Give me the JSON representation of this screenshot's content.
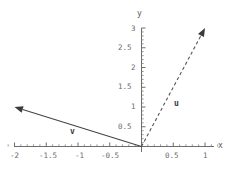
{
  "chart_data": {
    "type": "scatter",
    "title": "",
    "xlabel": "x",
    "ylabel": "y",
    "xlim": [
      -2.12,
      1.25
    ],
    "ylim": [
      -0.12,
      3.12
    ],
    "grid": false,
    "legend": "none",
    "x_ticks": [
      {
        "value": -2,
        "label": "-2"
      },
      {
        "value": -1.5,
        "label": "-1.5"
      },
      {
        "value": -1,
        "label": "-1"
      },
      {
        "value": -0.5,
        "label": "-0.5"
      },
      {
        "value": 0.5,
        "label": "0.5"
      },
      {
        "value": 1,
        "label": "1"
      }
    ],
    "y_ticks": [
      {
        "value": 0.5,
        "label": "0.5"
      },
      {
        "value": 1,
        "label": "1"
      },
      {
        "value": 1.5,
        "label": "1.5"
      },
      {
        "value": 2,
        "label": "2"
      },
      {
        "value": 2.5,
        "label": "2.5"
      },
      {
        "value": 3,
        "label": "3"
      }
    ],
    "x_minor_step": 0.1,
    "y_minor_step": 0.1,
    "series": [
      {
        "name": "u",
        "label": "u",
        "kind": "vector",
        "style": "dashed",
        "color": "#555555",
        "origin": [
          0,
          0
        ],
        "tip": [
          1,
          3
        ],
        "label_at": [
          0.31,
          1.23
        ]
      },
      {
        "name": "v",
        "label": "v",
        "kind": "vector",
        "style": "solid",
        "color": "#444444",
        "origin": [
          0,
          0
        ],
        "tip": [
          -2,
          1
        ],
        "label_at": [
          -1.09,
          0.21
        ]
      }
    ]
  },
  "axis_names": {
    "x": "x",
    "y": "y"
  },
  "vector_labels": {
    "u": "u",
    "v": "v"
  },
  "tick_text": {
    "x_m2": "-2",
    "x_m15": "-1.5",
    "x_m1": "-1",
    "x_m05": "-0.5",
    "x_p05": "0.5",
    "x_p1": "1",
    "y_05": "0.5",
    "y_1": "1",
    "y_15": "1.5",
    "y_2": "2",
    "y_25": "2.5",
    "y_3": "3"
  }
}
